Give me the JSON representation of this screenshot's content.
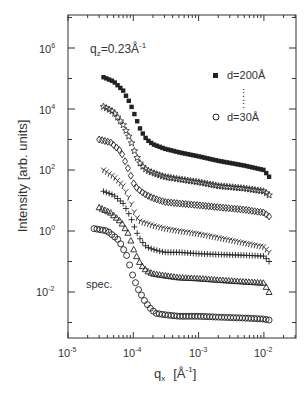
{
  "chart_data": {
    "type": "scatter",
    "title": "",
    "annotation": "q_z=0.23Å^-1",
    "annotation_parts": {
      "base": "q",
      "sub": "z",
      "rest": "=0.23Å",
      "sup": "-1"
    },
    "spec_label": "spec.",
    "xlabel": "q_x [Å^-1]",
    "xlabel_parts": {
      "base": "q",
      "sub": "x",
      "unit_open": "[Å",
      "sup": "-1",
      "unit_close": "]"
    },
    "ylabel": "Intensity [arb. units]",
    "xscale": "log",
    "yscale": "log",
    "xlim": [
      1e-05,
      0.03
    ],
    "ylim": [
      0.0003,
      13000000.0
    ],
    "xticks": [
      {
        "base": "10",
        "exp": "-5",
        "value": 1e-05
      },
      {
        "base": "10",
        "exp": "-4",
        "value": 0.0001
      },
      {
        "base": "10",
        "exp": "-3",
        "value": 0.001
      },
      {
        "base": "10",
        "exp": "-2",
        "value": 0.01
      }
    ],
    "yticks": [
      {
        "base": "10",
        "exp": "6",
        "value": 1000000.0
      },
      {
        "base": "10",
        "exp": "4",
        "value": 10000.0
      },
      {
        "base": "10",
        "exp": "2",
        "value": 100.0
      },
      {
        "base": "10",
        "exp": "0",
        "value": 1
      },
      {
        "base": "10",
        "exp": "-2",
        "value": 0.01
      }
    ],
    "legend": {
      "position": "upper right",
      "entries": [
        {
          "marker": "filled-square",
          "label": "d=200Å"
        },
        {
          "marker": "open-circle",
          "label": "d=30Å"
        }
      ],
      "ellipsis": "⋮"
    },
    "grid": false,
    "series": [
      {
        "name": "d=200Å",
        "marker": "filled-square",
        "x": [
          3.5e-05,
          5e-05,
          7e-05,
          9e-05,
          0.00011,
          0.00013,
          0.00016,
          0.0002,
          0.0003,
          0.0005,
          0.001,
          0.002,
          0.005,
          0.01,
          0.012
        ],
        "y": [
          110000.0,
          80000.0,
          40000.0,
          15000.0,
          5000.0,
          2000.0,
          1000.0,
          700,
          500,
          380,
          280,
          200,
          140,
          100,
          60
        ]
      },
      {
        "name": "d≈175Å",
        "marker": "open-star",
        "x": [
          3.5e-05,
          5e-05,
          7e-05,
          9e-05,
          0.00011,
          0.00013,
          0.00016,
          0.0002,
          0.0003,
          0.0005,
          0.001,
          0.002,
          0.005,
          0.01,
          0.012
        ],
        "y": [
          12000.0,
          8000.0,
          3000.0,
          1000.0,
          300,
          150,
          100,
          80,
          60,
          50,
          40,
          30,
          25,
          20,
          15
        ]
      },
      {
        "name": "d≈150Å",
        "marker": "open-diamond",
        "x": [
          3e-05,
          4.5e-05,
          6.5e-05,
          8.5e-05,
          0.000105,
          0.00013,
          0.00016,
          0.0002,
          0.0003,
          0.0005,
          0.001,
          0.002,
          0.005,
          0.01,
          0.012
        ],
        "y": [
          1000.0,
          800,
          400,
          100,
          30,
          20,
          15,
          12,
          9,
          8,
          7,
          6,
          5,
          4,
          3
        ]
      },
      {
        "name": "d≈100Å",
        "marker": "tri-y",
        "x": [
          3.5e-05,
          5e-05,
          7e-05,
          9e-05,
          0.00011,
          0.00013,
          0.00016,
          0.0002,
          0.0003,
          0.0005,
          0.001,
          0.002,
          0.005,
          0.01,
          0.012
        ],
        "y": [
          100,
          60,
          30,
          10,
          3,
          2,
          1.8,
          1.5,
          1.2,
          1,
          0.8,
          0.6,
          0.4,
          0.3,
          0.2
        ]
      },
      {
        "name": "d≈70Å",
        "marker": "plus",
        "x": [
          3.5e-05,
          5e-05,
          7e-05,
          9e-05,
          0.00011,
          0.00013,
          0.00016,
          0.0002,
          0.0003,
          0.0005,
          0.001,
          0.002,
          0.005,
          0.01,
          0.012
        ],
        "y": [
          20,
          15,
          8,
          3,
          1,
          0.5,
          0.3,
          0.25,
          0.2,
          0.2,
          0.18,
          0.17,
          0.16,
          0.15,
          0.1
        ]
      },
      {
        "name": "d≈50Å",
        "marker": "open-triangle",
        "x": [
          3e-05,
          4.5e-05,
          6.5e-05,
          8.5e-05,
          0.000105,
          0.00013,
          0.00016,
          0.0002,
          0.0003,
          0.0005,
          0.001,
          0.002,
          0.005,
          0.01,
          0.012
        ],
        "y": [
          6,
          4,
          2,
          0.8,
          0.2,
          0.08,
          0.05,
          0.04,
          0.035,
          0.03,
          0.028,
          0.025,
          0.022,
          0.02,
          0.01
        ]
      },
      {
        "name": "d=30Å",
        "marker": "open-circle",
        "x": [
          2.5e-05,
          4e-05,
          6e-05,
          8e-05,
          0.0001,
          0.00012,
          0.00015,
          0.00018,
          0.00022,
          0.0003,
          0.0005,
          0.001,
          0.002,
          0.005,
          0.01,
          0.012
        ],
        "y": [
          1.2,
          1,
          0.5,
          0.15,
          0.03,
          0.012,
          0.005,
          0.003,
          0.002,
          0.0018,
          0.0016,
          0.0016,
          0.0015,
          0.0014,
          0.0013,
          0.0012
        ]
      }
    ]
  }
}
